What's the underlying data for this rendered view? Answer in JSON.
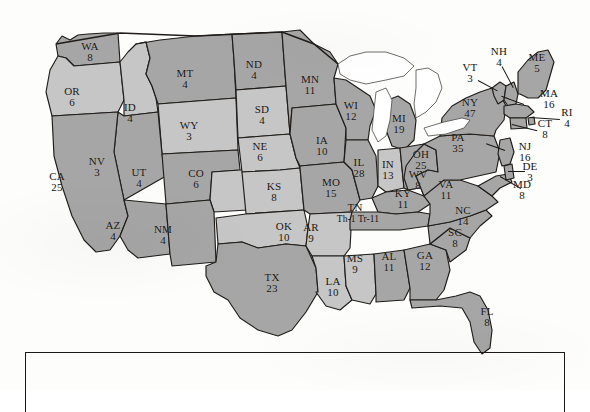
{
  "map": {
    "title": "United States electoral vote map",
    "colors": {
      "state_fill_dark": "#a6a6a6",
      "state_fill_light": "#c6c6c6",
      "border": "#1f1c19",
      "water": "#ffffff",
      "background": "#ffffff",
      "label_text": "#17140f"
    },
    "states": [
      {
        "abbr": "WA",
        "votes": "8",
        "x": 90,
        "y": 52,
        "shade": "dark"
      },
      {
        "abbr": "OR",
        "votes": "6",
        "x": 72,
        "y": 97,
        "shade": "light"
      },
      {
        "abbr": "ID",
        "votes": "4",
        "x": 130,
        "y": 113,
        "shade": "light"
      },
      {
        "abbr": "MT",
        "votes": "4",
        "x": 185,
        "y": 79,
        "shade": "dark"
      },
      {
        "abbr": "WY",
        "votes": "3",
        "x": 189,
        "y": 131,
        "shade": "light"
      },
      {
        "abbr": "NV",
        "votes": "3",
        "x": 97,
        "y": 167,
        "shade": "dark"
      },
      {
        "abbr": "CA",
        "votes": "25",
        "x": 57,
        "y": 182,
        "shade": "dark"
      },
      {
        "abbr": "UT",
        "votes": "4",
        "x": 139,
        "y": 178,
        "shade": "dark"
      },
      {
        "abbr": "CO",
        "votes": "6",
        "x": 196,
        "y": 179,
        "shade": "light"
      },
      {
        "abbr": "AZ",
        "votes": "4",
        "x": 113,
        "y": 231,
        "shade": "dark"
      },
      {
        "abbr": "NM",
        "votes": "4",
        "x": 163,
        "y": 235,
        "shade": "dark"
      },
      {
        "abbr": "TX",
        "votes": "23",
        "x": 272,
        "y": 283,
        "shade": "dark"
      },
      {
        "abbr": "OK",
        "votes": "10",
        "x": 284,
        "y": 232,
        "shade": "light"
      },
      {
        "abbr": "KS",
        "votes": "8",
        "x": 274,
        "y": 192,
        "shade": "light"
      },
      {
        "abbr": "NE",
        "votes": "6",
        "x": 260,
        "y": 152,
        "shade": "light"
      },
      {
        "abbr": "SD",
        "votes": "4",
        "x": 262,
        "y": 115,
        "shade": "light"
      },
      {
        "abbr": "ND",
        "votes": "4",
        "x": 254,
        "y": 70,
        "shade": "dark"
      },
      {
        "abbr": "MN",
        "votes": "11",
        "x": 310,
        "y": 85,
        "shade": "dark"
      },
      {
        "abbr": "IA",
        "votes": "10",
        "x": 322,
        "y": 146,
        "shade": "dark"
      },
      {
        "abbr": "MO",
        "votes": "15",
        "x": 331,
        "y": 188,
        "shade": "dark"
      },
      {
        "abbr": "AR",
        "votes": "9",
        "x": 311,
        "y": 233,
        "shade": "light"
      },
      {
        "abbr": "LA",
        "votes": "10",
        "x": 333,
        "y": 287,
        "shade": "light"
      },
      {
        "abbr": "MS",
        "votes": "9",
        "x": 355,
        "y": 264,
        "shade": "light"
      },
      {
        "abbr": "AL",
        "votes": "11",
        "x": 389,
        "y": 262,
        "shade": "dark"
      },
      {
        "abbr": "WI",
        "votes": "12",
        "x": 351,
        "y": 111,
        "shade": "dark"
      },
      {
        "abbr": "IL",
        "votes": "28",
        "x": 359,
        "y": 168,
        "shade": "dark"
      },
      {
        "abbr": "MI",
        "votes": "19",
        "x": 399,
        "y": 124,
        "shade": "dark"
      },
      {
        "abbr": "IN",
        "votes": "13",
        "x": 388,
        "y": 170,
        "shade": "light"
      },
      {
        "abbr": "OH",
        "votes": "25",
        "x": 421,
        "y": 160,
        "shade": "dark"
      },
      {
        "abbr": "KY",
        "votes": "11",
        "x": 403,
        "y": 199,
        "shade": "dark"
      },
      {
        "abbr": "GA",
        "votes": "12",
        "x": 425,
        "y": 261,
        "shade": "dark"
      },
      {
        "abbr": "SC",
        "votes": "8",
        "x": 455,
        "y": 238,
        "shade": "dark"
      },
      {
        "abbr": "NC",
        "votes": "14",
        "x": 463,
        "y": 216,
        "shade": "dark"
      },
      {
        "abbr": "VA",
        "votes": "11",
        "x": 446,
        "y": 190,
        "shade": "dark"
      },
      {
        "abbr": "WV",
        "votes": "8",
        "x": 418,
        "y": 180,
        "shade": "dark"
      },
      {
        "abbr": "FL",
        "votes": "8",
        "x": 487,
        "y": 317,
        "shade": "dark"
      },
      {
        "abbr": "PA",
        "votes": "35",
        "x": 458,
        "y": 143,
        "shade": "dark"
      },
      {
        "abbr": "NY",
        "votes": "47",
        "x": 470,
        "y": 108,
        "shade": "dark"
      },
      {
        "abbr": "VT",
        "votes": "3",
        "x": 470,
        "y": 73,
        "shade": "dark"
      },
      {
        "abbr": "NH",
        "votes": "4",
        "x": 499,
        "y": 57,
        "shade": "dark"
      },
      {
        "abbr": "ME",
        "votes": "5",
        "x": 537,
        "y": 63,
        "shade": "dark"
      },
      {
        "abbr": "MA",
        "votes": "16",
        "x": 549,
        "y": 99,
        "shade": "dark"
      },
      {
        "abbr": "RI",
        "votes": "4",
        "x": 567,
        "y": 118,
        "shade": "dark"
      },
      {
        "abbr": "CT",
        "votes": "8",
        "x": 545,
        "y": 129,
        "shade": "dark"
      },
      {
        "abbr": "NJ",
        "votes": "16",
        "x": 525,
        "y": 152,
        "shade": "dark"
      },
      {
        "abbr": "DE",
        "votes": "3",
        "x": 530,
        "y": 172,
        "shade": "dark"
      },
      {
        "abbr": "MD",
        "votes": "8",
        "x": 522,
        "y": 190,
        "shade": "dark"
      }
    ],
    "split_vote_states": [
      {
        "abbr": "TN",
        "x": 355,
        "y": 208,
        "annotation": "Th-1  Tr-11",
        "annotation_x": 358,
        "annotation_y": 219
      }
    ],
    "leader_lines": [
      {
        "name": "vt-leader",
        "x": 478,
        "y": 80,
        "length": 22,
        "angle": 28
      },
      {
        "name": "nh-leader",
        "x": 502,
        "y": 66,
        "length": 24,
        "angle": 62
      },
      {
        "name": "ma-leader",
        "x": 524,
        "y": 104,
        "length": 24,
        "angle": 200
      },
      {
        "name": "ri-leader",
        "x": 530,
        "y": 117,
        "length": 30,
        "angle": 4
      },
      {
        "name": "ct-leader",
        "x": 512,
        "y": 124,
        "length": 26,
        "angle": 14
      },
      {
        "name": "nj-leader",
        "x": 505,
        "y": 150,
        "length": 20,
        "angle": 200
      },
      {
        "name": "de-leader",
        "x": 508,
        "y": 171,
        "length": 17,
        "angle": 0
      },
      {
        "name": "md-leader",
        "x": 500,
        "y": 176,
        "length": 24,
        "angle": 30
      }
    ],
    "legend": {
      "present": true,
      "text": ""
    }
  }
}
